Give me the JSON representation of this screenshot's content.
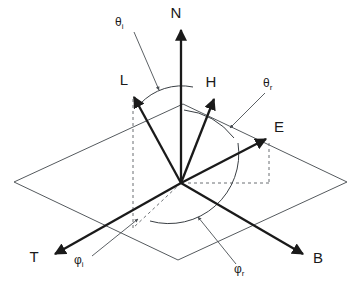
{
  "diagram": {
    "background_color": "#ffffff",
    "line_color": "#1a1a1a",
    "plane_color": "#555a5e",
    "dash_color": "#6b6f73",
    "origin": {
      "x": 181,
      "y": 183
    },
    "surface_plane": {
      "name": "tangent-plane",
      "corners": [
        {
          "x": 14,
          "y": 182
        },
        {
          "x": 183,
          "y": 104
        },
        {
          "x": 347,
          "y": 182
        },
        {
          "x": 178,
          "y": 260
        }
      ]
    },
    "vectors": [
      {
        "id": "N",
        "label": "N",
        "tip": {
          "x": 181,
          "y": 27
        },
        "label_pos": {
          "x": 176,
          "y": 18
        }
      },
      {
        "id": "L",
        "label": "L",
        "tip": {
          "x": 133,
          "y": 94
        },
        "label_pos": {
          "x": 122,
          "y": 85
        }
      },
      {
        "id": "H",
        "label": "H",
        "tip": {
          "x": 215,
          "y": 96
        },
        "label_pos": {
          "x": 208,
          "y": 87
        }
      },
      {
        "id": "E",
        "label": "E",
        "tip": {
          "x": 269,
          "y": 136
        },
        "label_pos": {
          "x": 276,
          "y": 131
        }
      },
      {
        "id": "T",
        "label": "T",
        "tip": {
          "x": 52,
          "y": 256
        },
        "label_pos": {
          "x": 33,
          "y": 262
        }
      },
      {
        "id": "B",
        "label": "B",
        "tip": {
          "x": 306,
          "y": 256
        },
        "label_pos": {
          "x": 314,
          "y": 263
        }
      }
    ],
    "angles": [
      {
        "id": "theta_i",
        "symbol": "θ",
        "subscript": "i",
        "label_pos": {
          "x": 118,
          "y": 26
        },
        "leader_from": {
          "x": 133,
          "y": 31
        },
        "leader_to": {
          "x": 160,
          "y": 92
        }
      },
      {
        "id": "theta_r",
        "symbol": "θ",
        "subscript": "r",
        "label_pos": {
          "x": 266,
          "y": 87
        },
        "leader_from": {
          "x": 266,
          "y": 92
        },
        "leader_to": {
          "x": 228,
          "y": 130
        }
      },
      {
        "id": "phi_i",
        "symbol": "φ",
        "subscript": "i",
        "label_pos": {
          "x": 77,
          "y": 263
        },
        "leader_from": {
          "x": 90,
          "y": 257
        },
        "leader_to": {
          "x": 140,
          "y": 218
        }
      },
      {
        "id": "phi_r",
        "symbol": "φ",
        "subscript": "r",
        "label_pos": {
          "x": 238,
          "y": 272
        },
        "leader_from": {
          "x": 238,
          "y": 265
        },
        "leader_to": {
          "x": 196,
          "y": 215
        }
      }
    ],
    "arcs": [
      {
        "id": "theta-i-arc",
        "desc": "arc between L and N"
      },
      {
        "id": "theta-r-arc",
        "desc": "arc between N and E"
      },
      {
        "id": "phi-arc",
        "desc": "azimuth arc in tangent plane"
      }
    ],
    "dashed_guides": [
      {
        "id": "L-projection-vertical",
        "desc": "vertical drop from L to tangent plane"
      },
      {
        "id": "L-projection-in-plane",
        "desc": "projection of L in tangent plane"
      },
      {
        "id": "E-projection-vertical",
        "desc": "vertical drop from E to tangent plane"
      },
      {
        "id": "E-projection-in-plane",
        "desc": "projection of E in tangent plane"
      }
    ]
  }
}
